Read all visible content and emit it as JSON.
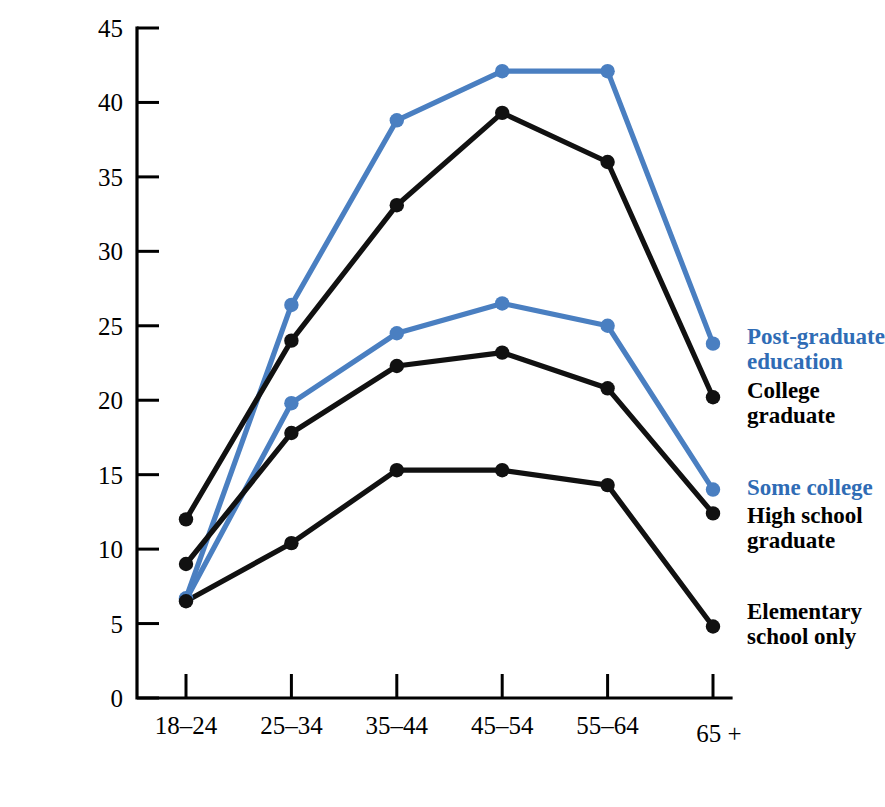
{
  "chart_data": {
    "type": "line",
    "title": "",
    "xlabel": "Age",
    "ylabel": "Annual earnings (thousands of dollars)",
    "categories": [
      "18–24",
      "25–34",
      "35–44",
      "45–54",
      "55–64",
      "65 +"
    ],
    "ylim": [
      0,
      45
    ],
    "yticks": [
      0,
      5,
      10,
      15,
      20,
      25,
      30,
      35,
      40,
      45
    ],
    "ytick_labels": [
      "0",
      "5",
      "10",
      "15",
      "20",
      "25",
      "30",
      "35",
      "40",
      "45"
    ],
    "grid": false,
    "legend_position": "right-line-end",
    "series": [
      {
        "name": "Post-graduate education",
        "color": "#4a7fc1",
        "values": [
          6.7,
          26.4,
          38.8,
          42.1,
          42.1,
          23.8
        ]
      },
      {
        "name": "College graduate",
        "color": "#111111",
        "values": [
          12.0,
          24.0,
          33.1,
          39.3,
          36.0,
          20.2
        ]
      },
      {
        "name": "Some college",
        "color": "#4a7fc1",
        "values": [
          6.6,
          19.8,
          24.5,
          26.5,
          25.0,
          14.0
        ]
      },
      {
        "name": "High school graduate",
        "color": "#111111",
        "values": [
          9.0,
          17.8,
          22.3,
          23.2,
          20.8,
          12.4
        ]
      },
      {
        "name": "Elementary school only",
        "color": "#111111",
        "values": [
          6.5,
          10.4,
          15.3,
          15.3,
          14.3,
          4.8
        ]
      }
    ],
    "legend_entries": [
      {
        "label": "Post-graduate\neducation",
        "color": "#2f6cb5"
      },
      {
        "label": "College\ngraduate",
        "color": "#000000"
      },
      {
        "label": "Some college",
        "color": "#2f6cb5"
      },
      {
        "label": "High school\ngraduate",
        "color": "#000000"
      },
      {
        "label": "Elementary\nschool only",
        "color": "#000000"
      }
    ]
  },
  "colors": {
    "blue": "#4a7fc1",
    "blue_text": "#2f6cb5",
    "black": "#111111",
    "background": "#ffffff"
  }
}
